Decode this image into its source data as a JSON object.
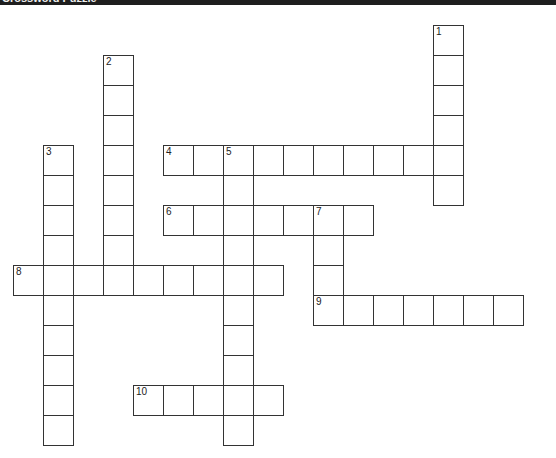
{
  "window": {
    "title": "Crossword Puzzle"
  },
  "grid": {
    "cell_size": 30,
    "origin_x": 14,
    "origin_y": 26,
    "border_color": "#333333"
  },
  "words": [
    {
      "number": "1",
      "direction": "down",
      "row": 0,
      "col": 14,
      "length": 6
    },
    {
      "number": "2",
      "direction": "down",
      "row": 1,
      "col": 3,
      "length": 8
    },
    {
      "number": "3",
      "direction": "down",
      "row": 4,
      "col": 1,
      "length": 10
    },
    {
      "number": "4",
      "direction": "across",
      "row": 4,
      "col": 5,
      "length": 10
    },
    {
      "number": "5",
      "direction": "down",
      "row": 4,
      "col": 7,
      "length": 10
    },
    {
      "number": "6",
      "direction": "across",
      "row": 6,
      "col": 5,
      "length": 7
    },
    {
      "number": "7",
      "direction": "down",
      "row": 6,
      "col": 10,
      "length": 4
    },
    {
      "number": "8",
      "direction": "across",
      "row": 8,
      "col": 0,
      "length": 9
    },
    {
      "number": "9",
      "direction": "across",
      "row": 9,
      "col": 10,
      "length": 7
    },
    {
      "number": "10",
      "direction": "across",
      "row": 12,
      "col": 4,
      "length": 5
    }
  ]
}
